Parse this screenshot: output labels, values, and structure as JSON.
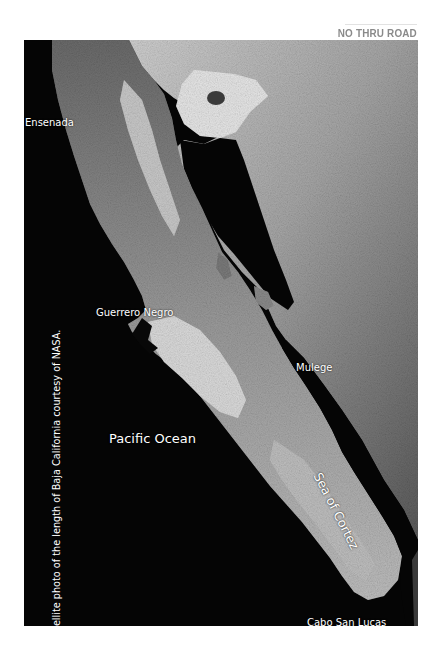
{
  "header": {
    "title": "NO THRU ROAD"
  },
  "map": {
    "type": "satellite-photo",
    "region": "Baja California",
    "colors": {
      "water": "#050505",
      "land_light": "#d8d8d8",
      "land_mid": "#8c8c8c",
      "land_dark": "#3c3c3c",
      "label": "#ffffff",
      "header": "#8a8a8a"
    },
    "labels": {
      "ensenada": "Ensenada",
      "guerrero_negro": "Guerrero Negro",
      "mulege": "Mulege",
      "pacific_ocean": "Pacific Ocean",
      "sea_of_cortez": "Sea of Cortez",
      "cabo_san_lucas": "Cabo San Lucas"
    },
    "caption": "Satellite photo of the length of Baja California courtesy of NASA."
  }
}
